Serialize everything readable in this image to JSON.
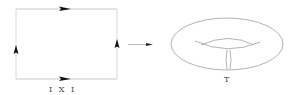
{
  "diagram": {
    "square_label": "I X I",
    "torus_label": "T",
    "colors": {
      "line": "#bdbdbd",
      "arrow": "#111111",
      "torus": "#9a9a9a",
      "text": "#444444"
    }
  }
}
